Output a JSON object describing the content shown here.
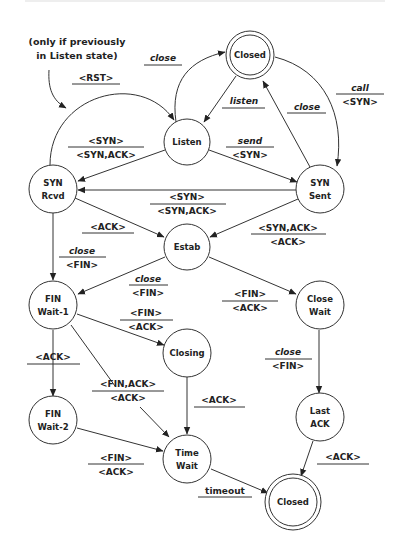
{
  "diagram": {
    "note": {
      "line1": "(only if previously",
      "line2": "in Listen state)"
    },
    "states": {
      "closed_top": "Closed",
      "listen": "Listen",
      "syn_rcvd": {
        "l1": "SYN",
        "l2": "Rcvd"
      },
      "syn_sent": {
        "l1": "SYN",
        "l2": "Sent"
      },
      "estab": "Estab",
      "fin_wait_1": {
        "l1": "FIN",
        "l2": "Wait-1"
      },
      "close_wait": {
        "l1": "Close",
        "l2": "Wait"
      },
      "closing": "Closing",
      "fin_wait_2": {
        "l1": "FIN",
        "l2": "Wait-2"
      },
      "time_wait": {
        "l1": "Time",
        "l2": "Wait"
      },
      "last_ack": {
        "l1": "Last",
        "l2": "ACK"
      },
      "closed_bottom": "Closed"
    },
    "transitions": {
      "listen_close": {
        "event": "close",
        "action": ""
      },
      "rst": {
        "event": "<RST>",
        "action": ""
      },
      "listen": {
        "event": "listen",
        "action": ""
      },
      "synsent_close": {
        "event": "close",
        "action": ""
      },
      "call": {
        "event": "call",
        "action": "<SYN>"
      },
      "listen_synrcvd": {
        "event": "<SYN>",
        "action": "<SYN,ACK>"
      },
      "send": {
        "event": "send",
        "action": "<SYN>"
      },
      "synsent_synrcvd": {
        "event": "<SYN>",
        "action": "<SYN,ACK>"
      },
      "synrcvd_estab": {
        "event": "<ACK>",
        "action": ""
      },
      "synsent_estab": {
        "event": "<SYN,ACK>",
        "action": "<ACK>"
      },
      "synrcvd_finwait1": {
        "event": "close",
        "action": "<FIN>"
      },
      "estab_finwait1": {
        "event": "close",
        "action": "<FIN>"
      },
      "estab_closewait": {
        "event": "<FIN>",
        "action": "<ACK>"
      },
      "finwait1_closing": {
        "event": "<FIN>",
        "action": "<ACK>"
      },
      "finwait1_finwait2": {
        "event": "<ACK>",
        "action": ""
      },
      "finwait1_timewait": {
        "event": "<FIN,ACK>",
        "action": "<ACK>"
      },
      "closing_timewait": {
        "event": "<ACK>",
        "action": ""
      },
      "closewait_lastack": {
        "event": "close",
        "action": "<FIN>"
      },
      "finwait2_timewait": {
        "event": "<FIN>",
        "action": "<ACK>"
      },
      "lastack_closed": {
        "event": "<ACK>",
        "action": ""
      },
      "timeout": {
        "event": "timeout",
        "action": ""
      }
    }
  }
}
